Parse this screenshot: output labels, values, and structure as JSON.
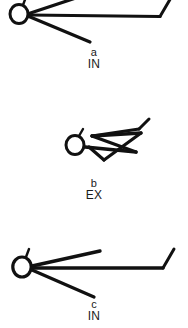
{
  "figure": {
    "title": "",
    "background_color": "#ffffff",
    "stroke_color": "#111111",
    "width": 188,
    "height": 328
  },
  "panels": [
    {
      "id": "a",
      "letter": "a",
      "code": "IN",
      "description": "soma circle at left with three straight processes radiating to the right; long horizontal process ends with short upward hook at far right",
      "soma": {
        "cx": 19,
        "cy": 14,
        "rx": 9.5,
        "ry": 10,
        "stub_angle": "up-right"
      },
      "strokes": [
        {
          "name": "process-upper",
          "points": [
            [
              29,
              14
            ],
            [
              110,
              -12
            ]
          ]
        },
        {
          "name": "process-horizontal",
          "points": [
            [
              29,
              15
            ],
            [
              160,
              16
            ]
          ]
        },
        {
          "name": "process-hook",
          "points": [
            [
              160,
              16
            ],
            [
              172,
              -4
            ]
          ]
        },
        {
          "name": "process-lower",
          "points": [
            [
              29,
              16
            ],
            [
              90,
              42
            ]
          ]
        }
      ]
    },
    {
      "id": "b",
      "letter": "b",
      "code": "EX",
      "description": "soma circle at left with dense zigzag of overlapping processes extending to the right, terminating in an upward hook",
      "soma": {
        "cx": 75,
        "cy": 145,
        "rx": 9.5,
        "ry": 10,
        "stub_angle": "up-right"
      },
      "strokes": [
        {
          "name": "zigzag-segment-1",
          "points": [
            [
              85,
              147
            ],
            [
              134,
              152
            ]
          ]
        },
        {
          "name": "zigzag-segment-2",
          "points": [
            [
              134,
              152
            ],
            [
              92,
              136
            ]
          ]
        },
        {
          "name": "zigzag-segment-3",
          "points": [
            [
              92,
              136
            ],
            [
              140,
              133
            ]
          ]
        },
        {
          "name": "zigzag-segment-4",
          "points": [
            [
              140,
              133
            ],
            [
              104,
              160
            ]
          ]
        },
        {
          "name": "zigzag-segment-5",
          "points": [
            [
              104,
              160
            ],
            [
              90,
              146
            ]
          ]
        },
        {
          "name": "zigzag-upper-branch",
          "points": [
            [
              92,
              136
            ],
            [
              139,
              129
            ]
          ]
        },
        {
          "name": "zigzag-hook",
          "points": [
            [
              139,
              129
            ],
            [
              148,
              119
            ]
          ]
        }
      ]
    },
    {
      "id": "c",
      "letter": "c",
      "code": "IN",
      "description": "soma circle at left with three straight processes radiating to the right; long horizontal process ends with short upward hook at far right",
      "soma": {
        "cx": 22,
        "cy": 267,
        "rx": 9.5,
        "ry": 10.5,
        "stub_angle": "up-right"
      },
      "strokes": [
        {
          "name": "process-upper",
          "points": [
            [
              32,
              266
            ],
            [
              99,
              251
            ]
          ]
        },
        {
          "name": "process-horizontal",
          "points": [
            [
              32,
              268
            ],
            [
              163,
              268
            ]
          ]
        },
        {
          "name": "process-hook",
          "points": [
            [
              163,
              268
            ],
            [
              174,
              249
            ]
          ]
        },
        {
          "name": "process-lower",
          "points": [
            [
              32,
              270
            ],
            [
              93,
              297
            ]
          ]
        }
      ]
    }
  ]
}
